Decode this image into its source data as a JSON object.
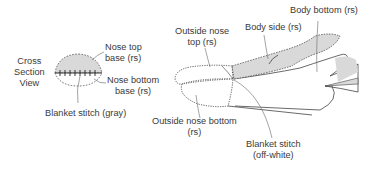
{
  "diagram": {
    "type": "sewing pattern illustration",
    "colors": {
      "fill_gray": "#d9d9d9",
      "outline": "#444444",
      "leader": "#555555"
    },
    "cross_section": {
      "title_line1": "Cross",
      "title_line2": "Section",
      "title_line3": "View",
      "nose_top_base_line1": "Nose top",
      "nose_top_base_line2": "base (rs)",
      "nose_bottom_base_line1": "Nose bottom",
      "nose_bottom_base_line2": "base (rs)",
      "blanket_stitch": "Blanket stitch (gray)"
    },
    "side_view": {
      "outside_nose_top_line1": "Outside nose",
      "outside_nose_top_line2": "top (rs)",
      "body_side": "Body side (rs)",
      "body_bottom": "Body bottom (rs)",
      "outside_nose_bottom_line1": "Outside nose bottom",
      "outside_nose_bottom_line2": "(rs)",
      "blanket_stitch_line1": "Blanket stitch",
      "blanket_stitch_line2": "(off-white)"
    }
  }
}
